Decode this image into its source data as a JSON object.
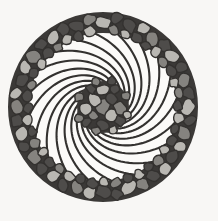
{
  "artwork": {
    "title": "Pebble Mosaic Spiral Mandala",
    "subject": "circular cobblestone rosette with logarithmic spiral arms",
    "medium": "grayscale line illustration",
    "canvas": {
      "width": 218,
      "height": 221,
      "background_color": "#f8f7f5"
    },
    "composition": {
      "center_x": 103,
      "center_y": 107,
      "outer_radius": 95,
      "border_ring_inner_radius": 74,
      "border_ring_outer_radius": 95,
      "core_radius": 26,
      "spiral_arm_count": 20,
      "spiral_direction": "counterclockwise",
      "spiral_growth_factor": 0.165,
      "spiral_sweep_degrees": 118
    },
    "palette": {
      "background": "#f8f7f5",
      "outline": "#33312f",
      "petal_fill": "#fbfaf8",
      "pebble_dark": "#4e4c4a",
      "pebble_mid": "#85837f",
      "pebble_light": "#b9b7b2",
      "pebble_pale": "#d2d0cb",
      "grout": "#3b3937"
    },
    "layers": [
      {
        "name": "background",
        "label": "Off-white paper ground"
      },
      {
        "name": "outer-pebble-ring",
        "label": "Cobblestone border ring"
      },
      {
        "name": "spiral-arms",
        "label": "Twenty curved spiral petals"
      },
      {
        "name": "core-cluster",
        "label": "Central pebble cluster"
      }
    ],
    "outer_ring_stones": [
      {
        "angle": 0,
        "radius": 84,
        "rx": 8.5,
        "ry": 6.4,
        "rot": 12,
        "tone": "pebble_light"
      },
      {
        "angle": 9,
        "radius": 90,
        "rx": 6.2,
        "ry": 5.4,
        "rot": -20,
        "tone": "pebble_dark"
      },
      {
        "angle": 8,
        "radius": 78,
        "rx": 5.8,
        "ry": 5.0,
        "rot": 33,
        "tone": "pebble_mid"
      },
      {
        "angle": 18,
        "radius": 85,
        "rx": 7.6,
        "ry": 6.0,
        "rot": 50,
        "tone": "pebble_dark"
      },
      {
        "angle": 17,
        "radius": 76,
        "rx": 5.2,
        "ry": 4.6,
        "rot": 5,
        "tone": "pebble_light"
      },
      {
        "angle": 27,
        "radius": 88,
        "rx": 6.6,
        "ry": 5.8,
        "rot": -35,
        "tone": "pebble_light"
      },
      {
        "angle": 26,
        "radius": 77,
        "rx": 6.0,
        "ry": 4.8,
        "rot": 18,
        "tone": "pebble_dark"
      },
      {
        "angle": 36,
        "radius": 85,
        "rx": 7.8,
        "ry": 6.2,
        "rot": 62,
        "tone": "pebble_mid"
      },
      {
        "angle": 35,
        "radius": 75,
        "rx": 5.0,
        "ry": 4.4,
        "rot": -12,
        "tone": "pebble_dark"
      },
      {
        "angle": 45,
        "radius": 87,
        "rx": 7.0,
        "ry": 6.0,
        "rot": 24,
        "tone": "pebble_dark"
      },
      {
        "angle": 44,
        "radius": 77,
        "rx": 5.6,
        "ry": 5.0,
        "rot": 48,
        "tone": "pebble_light"
      },
      {
        "angle": 54,
        "radius": 85,
        "rx": 8.0,
        "ry": 6.0,
        "rot": -28,
        "tone": "pebble_light"
      },
      {
        "angle": 53,
        "radius": 75,
        "rx": 5.2,
        "ry": 4.6,
        "rot": 14,
        "tone": "pebble_mid"
      },
      {
        "angle": 63,
        "radius": 88,
        "rx": 6.4,
        "ry": 5.6,
        "rot": 40,
        "tone": "pebble_dark"
      },
      {
        "angle": 62,
        "radius": 77,
        "rx": 5.8,
        "ry": 4.8,
        "rot": -8,
        "tone": "pebble_dark"
      },
      {
        "angle": 72,
        "radius": 85,
        "rx": 7.4,
        "ry": 6.2,
        "rot": 55,
        "tone": "pebble_mid"
      },
      {
        "angle": 71,
        "radius": 75,
        "rx": 5.0,
        "ry": 4.4,
        "rot": 22,
        "tone": "pebble_light"
      },
      {
        "angle": 81,
        "radius": 87,
        "rx": 6.8,
        "ry": 5.8,
        "rot": -40,
        "tone": "pebble_dark"
      },
      {
        "angle": 80,
        "radius": 77,
        "rx": 5.4,
        "ry": 4.8,
        "rot": 10,
        "tone": "pebble_mid"
      },
      {
        "angle": 90,
        "radius": 85,
        "rx": 8.2,
        "ry": 6.4,
        "rot": 30,
        "tone": "pebble_light"
      },
      {
        "angle": 89,
        "radius": 75,
        "rx": 5.2,
        "ry": 4.6,
        "rot": -18,
        "tone": "pebble_dark"
      },
      {
        "angle": 99,
        "radius": 88,
        "rx": 6.2,
        "ry": 5.4,
        "rot": 45,
        "tone": "pebble_dark"
      },
      {
        "angle": 98,
        "radius": 77,
        "rx": 5.8,
        "ry": 5.0,
        "rot": 8,
        "tone": "pebble_light"
      },
      {
        "angle": 108,
        "radius": 85,
        "rx": 7.6,
        "ry": 6.0,
        "rot": -30,
        "tone": "pebble_mid"
      },
      {
        "angle": 107,
        "radius": 75,
        "rx": 5.0,
        "ry": 4.4,
        "rot": 26,
        "tone": "pebble_dark"
      },
      {
        "angle": 117,
        "radius": 87,
        "rx": 7.0,
        "ry": 6.0,
        "rot": 52,
        "tone": "pebble_light"
      },
      {
        "angle": 116,
        "radius": 77,
        "rx": 5.6,
        "ry": 4.8,
        "rot": -6,
        "tone": "pebble_dark"
      },
      {
        "angle": 126,
        "radius": 85,
        "rx": 8.0,
        "ry": 6.2,
        "rot": 16,
        "tone": "pebble_dark"
      },
      {
        "angle": 125,
        "radius": 75,
        "rx": 5.2,
        "ry": 4.6,
        "rot": 38,
        "tone": "pebble_light"
      },
      {
        "angle": 135,
        "radius": 88,
        "rx": 6.6,
        "ry": 5.6,
        "rot": -24,
        "tone": "pebble_light"
      },
      {
        "angle": 134,
        "radius": 77,
        "rx": 5.8,
        "ry": 5.0,
        "rot": 12,
        "tone": "pebble_mid"
      },
      {
        "angle": 144,
        "radius": 85,
        "rx": 7.4,
        "ry": 6.0,
        "rot": 58,
        "tone": "pebble_dark"
      },
      {
        "angle": 143,
        "radius": 75,
        "rx": 5.0,
        "ry": 4.4,
        "rot": -14,
        "tone": "pebble_dark"
      },
      {
        "angle": 153,
        "radius": 87,
        "rx": 6.8,
        "ry": 5.8,
        "rot": 28,
        "tone": "pebble_mid"
      },
      {
        "angle": 152,
        "radius": 77,
        "rx": 5.4,
        "ry": 4.8,
        "rot": 44,
        "tone": "pebble_light"
      },
      {
        "angle": 162,
        "radius": 85,
        "rx": 8.2,
        "ry": 6.4,
        "rot": -32,
        "tone": "pebble_light"
      },
      {
        "angle": 161,
        "radius": 75,
        "rx": 5.2,
        "ry": 4.6,
        "rot": 6,
        "tone": "pebble_dark"
      },
      {
        "angle": 171,
        "radius": 88,
        "rx": 6.2,
        "ry": 5.4,
        "rot": 36,
        "tone": "pebble_dark"
      },
      {
        "angle": 170,
        "radius": 77,
        "rx": 5.8,
        "ry": 5.0,
        "rot": -10,
        "tone": "pebble_mid"
      },
      {
        "angle": 180,
        "radius": 85,
        "rx": 7.6,
        "ry": 6.0,
        "rot": 20,
        "tone": "pebble_dark"
      },
      {
        "angle": 179,
        "radius": 75,
        "rx": 5.0,
        "ry": 4.4,
        "rot": 46,
        "tone": "pebble_light"
      },
      {
        "angle": 189,
        "radius": 87,
        "rx": 7.0,
        "ry": 6.0,
        "rot": -26,
        "tone": "pebble_light"
      },
      {
        "angle": 188,
        "radius": 77,
        "rx": 5.6,
        "ry": 4.8,
        "rot": 15,
        "tone": "pebble_dark"
      },
      {
        "angle": 198,
        "radius": 85,
        "rx": 8.0,
        "ry": 6.2,
        "rot": 54,
        "tone": "pebble_mid"
      },
      {
        "angle": 197,
        "radius": 75,
        "rx": 5.2,
        "ry": 4.6,
        "rot": -16,
        "tone": "pebble_dark"
      },
      {
        "angle": 207,
        "radius": 88,
        "rx": 6.6,
        "ry": 5.6,
        "rot": 32,
        "tone": "pebble_dark"
      },
      {
        "angle": 206,
        "radius": 77,
        "rx": 5.8,
        "ry": 5.0,
        "rot": 4,
        "tone": "pebble_light"
      },
      {
        "angle": 216,
        "radius": 85,
        "rx": 7.4,
        "ry": 6.0,
        "rot": -36,
        "tone": "pebble_light"
      },
      {
        "angle": 215,
        "radius": 75,
        "rx": 5.0,
        "ry": 4.4,
        "rot": 24,
        "tone": "pebble_mid"
      },
      {
        "angle": 225,
        "radius": 87,
        "rx": 6.8,
        "ry": 5.8,
        "rot": 42,
        "tone": "pebble_dark"
      },
      {
        "angle": 224,
        "radius": 77,
        "rx": 5.4,
        "ry": 4.8,
        "rot": -4,
        "tone": "pebble_dark"
      },
      {
        "angle": 234,
        "radius": 85,
        "rx": 8.2,
        "ry": 6.4,
        "rot": 18,
        "tone": "pebble_mid"
      },
      {
        "angle": 233,
        "radius": 75,
        "rx": 5.2,
        "ry": 4.6,
        "rot": 50,
        "tone": "pebble_light"
      },
      {
        "angle": 243,
        "radius": 88,
        "rx": 6.2,
        "ry": 5.4,
        "rot": -22,
        "tone": "pebble_dark"
      },
      {
        "angle": 242,
        "radius": 77,
        "rx": 5.8,
        "ry": 5.0,
        "rot": 9,
        "tone": "pebble_mid"
      },
      {
        "angle": 252,
        "radius": 85,
        "rx": 7.6,
        "ry": 6.0,
        "rot": 60,
        "tone": "pebble_light"
      },
      {
        "angle": 251,
        "radius": 75,
        "rx": 5.0,
        "ry": 4.4,
        "rot": -13,
        "tone": "pebble_dark"
      },
      {
        "angle": 261,
        "radius": 87,
        "rx": 7.0,
        "ry": 6.0,
        "rot": 27,
        "tone": "pebble_dark"
      },
      {
        "angle": 260,
        "radius": 77,
        "rx": 5.6,
        "ry": 4.8,
        "rot": 41,
        "tone": "pebble_light"
      },
      {
        "angle": 270,
        "radius": 85,
        "rx": 8.0,
        "ry": 6.2,
        "rot": -29,
        "tone": "pebble_mid"
      },
      {
        "angle": 269,
        "radius": 75,
        "rx": 5.2,
        "ry": 4.6,
        "rot": 11,
        "tone": "pebble_dark"
      },
      {
        "angle": 279,
        "radius": 88,
        "rx": 6.6,
        "ry": 5.6,
        "rot": 37,
        "tone": "pebble_light"
      },
      {
        "angle": 278,
        "radius": 77,
        "rx": 5.8,
        "ry": 5.0,
        "rot": -7,
        "tone": "pebble_dark"
      },
      {
        "angle": 288,
        "radius": 85,
        "rx": 7.4,
        "ry": 6.0,
        "rot": 21,
        "tone": "pebble_dark"
      },
      {
        "angle": 287,
        "radius": 75,
        "rx": 5.0,
        "ry": 4.4,
        "rot": 47,
        "tone": "pebble_mid"
      },
      {
        "angle": 297,
        "radius": 87,
        "rx": 6.8,
        "ry": 5.8,
        "rot": -31,
        "tone": "pebble_light"
      },
      {
        "angle": 296,
        "radius": 77,
        "rx": 5.4,
        "ry": 4.8,
        "rot": 13,
        "tone": "pebble_dark"
      },
      {
        "angle": 306,
        "radius": 85,
        "rx": 8.2,
        "ry": 6.4,
        "rot": 56,
        "tone": "pebble_mid"
      },
      {
        "angle": 305,
        "radius": 75,
        "rx": 5.2,
        "ry": 4.6,
        "rot": -17,
        "tone": "pebble_light"
      },
      {
        "angle": 315,
        "radius": 88,
        "rx": 6.2,
        "ry": 5.4,
        "rot": 34,
        "tone": "pebble_dark"
      },
      {
        "angle": 314,
        "radius": 77,
        "rx": 5.8,
        "ry": 5.0,
        "rot": 3,
        "tone": "pebble_dark"
      },
      {
        "angle": 324,
        "radius": 85,
        "rx": 7.6,
        "ry": 6.0,
        "rot": -34,
        "tone": "pebble_light"
      },
      {
        "angle": 323,
        "radius": 75,
        "rx": 5.0,
        "ry": 4.4,
        "rot": 25,
        "tone": "pebble_mid"
      },
      {
        "angle": 333,
        "radius": 87,
        "rx": 7.0,
        "ry": 6.0,
        "rot": 43,
        "tone": "pebble_dark"
      },
      {
        "angle": 332,
        "radius": 77,
        "rx": 5.6,
        "ry": 4.8,
        "rot": -5,
        "tone": "pebble_light"
      },
      {
        "angle": 342,
        "radius": 85,
        "rx": 8.0,
        "ry": 6.2,
        "rot": 17,
        "tone": "pebble_dark"
      },
      {
        "angle": 341,
        "radius": 75,
        "rx": 5.2,
        "ry": 4.6,
        "rot": 51,
        "tone": "pebble_dark"
      },
      {
        "angle": 351,
        "radius": 88,
        "rx": 6.6,
        "ry": 5.6,
        "rot": -23,
        "tone": "pebble_mid"
      },
      {
        "angle": 350,
        "radius": 77,
        "rx": 5.8,
        "ry": 5.0,
        "rot": 7,
        "tone": "pebble_light"
      }
    ],
    "core_stones": [
      {
        "cx": 103,
        "cy": 107,
        "rx": 7.2,
        "ry": 9.0,
        "rot": 22,
        "tone": "pebble_mid"
      },
      {
        "cx": 94,
        "cy": 100,
        "rx": 6.0,
        "ry": 8.2,
        "rot": -30,
        "tone": "pebble_light"
      },
      {
        "cx": 112,
        "cy": 99,
        "rx": 6.4,
        "ry": 5.6,
        "rot": 40,
        "tone": "pebble_dark"
      },
      {
        "cx": 111,
        "cy": 116,
        "rx": 7.0,
        "ry": 6.0,
        "rot": -15,
        "tone": "pebble_light"
      },
      {
        "cx": 93,
        "cy": 115,
        "rx": 5.6,
        "ry": 5.0,
        "rot": 55,
        "tone": "pebble_mid"
      },
      {
        "cx": 103,
        "cy": 90,
        "rx": 6.6,
        "ry": 5.2,
        "rot": 8,
        "tone": "pebble_light"
      },
      {
        "cx": 120,
        "cy": 108,
        "rx": 5.8,
        "ry": 6.4,
        "rot": -42,
        "tone": "pebble_mid"
      },
      {
        "cx": 103,
        "cy": 125,
        "rx": 6.2,
        "ry": 5.4,
        "rot": 28,
        "tone": "pebble_dark"
      },
      {
        "cx": 86,
        "cy": 109,
        "rx": 6.0,
        "ry": 6.8,
        "rot": 14,
        "tone": "pebble_light"
      },
      {
        "cx": 115,
        "cy": 89,
        "rx": 5.0,
        "ry": 4.6,
        "rot": -20,
        "tone": "pebble_dark"
      },
      {
        "cx": 91,
        "cy": 89,
        "rx": 5.2,
        "ry": 4.4,
        "rot": 35,
        "tone": "pebble_dark"
      },
      {
        "cx": 120,
        "cy": 121,
        "rx": 5.4,
        "ry": 4.8,
        "rot": 48,
        "tone": "pebble_dark"
      },
      {
        "cx": 86,
        "cy": 122,
        "rx": 5.0,
        "ry": 4.6,
        "rot": -10,
        "tone": "pebble_dark"
      },
      {
        "cx": 126,
        "cy": 96,
        "rx": 4.6,
        "ry": 4.2,
        "rot": 18,
        "tone": "pebble_mid"
      },
      {
        "cx": 79,
        "cy": 97,
        "rx": 4.8,
        "ry": 4.4,
        "rot": -38,
        "tone": "pebble_mid"
      },
      {
        "cx": 127,
        "cy": 115,
        "rx": 4.4,
        "ry": 4.0,
        "rot": 26,
        "tone": "pebble_light"
      },
      {
        "cx": 79,
        "cy": 118,
        "rx": 4.6,
        "ry": 4.2,
        "rot": 44,
        "tone": "pebble_mid"
      },
      {
        "cx": 96,
        "cy": 82,
        "rx": 4.6,
        "ry": 4.0,
        "rot": -12,
        "tone": "pebble_mid"
      },
      {
        "cx": 112,
        "cy": 81,
        "rx": 4.4,
        "ry": 4.2,
        "rot": 30,
        "tone": "pebble_dark"
      },
      {
        "cx": 96,
        "cy": 131,
        "rx": 4.4,
        "ry": 4.0,
        "rot": 16,
        "tone": "pebble_mid"
      },
      {
        "cx": 113,
        "cy": 130,
        "rx": 4.6,
        "ry": 4.2,
        "rot": -26,
        "tone": "pebble_light"
      }
    ]
  }
}
